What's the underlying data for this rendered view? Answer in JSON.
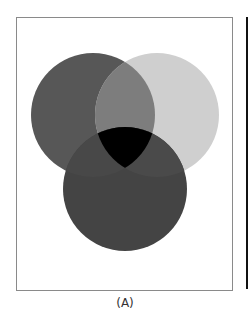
{
  "figure": {
    "caption": "(A)",
    "frame_border_color": "#8a8a8a"
  },
  "venn": {
    "circles": [
      {
        "name": "top-left",
        "cx": 93,
        "cy": 115,
        "r": 62,
        "color": "#575757"
      },
      {
        "name": "top-right",
        "cx": 157,
        "cy": 115,
        "r": 62,
        "color": "#cfcfcf"
      },
      {
        "name": "bottom",
        "cx": 125,
        "cy": 189,
        "r": 62,
        "color": "#444444"
      }
    ],
    "overlaps": {
      "top_left_top_right": "#7d7d7d",
      "top_left_bottom": "#484848",
      "top_right_bottom": "#4a4a4a",
      "all_three": "#000000"
    }
  }
}
